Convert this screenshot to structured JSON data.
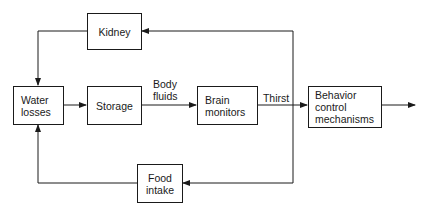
{
  "diagram": {
    "nodes": {
      "kidney": {
        "label": "Kidney"
      },
      "water_losses": {
        "label": "Water\nlosses"
      },
      "storage": {
        "label": "Storage"
      },
      "brain_monitors": {
        "label": "Brain\nmonitors"
      },
      "behavior": {
        "label": "Behavior\ncontrol\nmechanisms"
      },
      "food_intake": {
        "label": "Food\nintake"
      }
    },
    "edge_labels": {
      "body_fluids": "Body\nfluids",
      "thirst": "Thirst"
    },
    "edges": [
      {
        "from": "water_losses",
        "to": "storage"
      },
      {
        "from": "storage",
        "to": "brain_monitors",
        "label": "Body fluids"
      },
      {
        "from": "brain_monitors",
        "to": "behavior",
        "label": "Thirst"
      },
      {
        "from": "behavior",
        "to": "output"
      },
      {
        "from": "thirst_junction",
        "to": "kidney"
      },
      {
        "from": "kidney",
        "to": "water_losses"
      },
      {
        "from": "thirst_junction",
        "to": "food_intake"
      },
      {
        "from": "food_intake",
        "to": "water_losses"
      }
    ],
    "line_color": "#1a1a1a"
  }
}
